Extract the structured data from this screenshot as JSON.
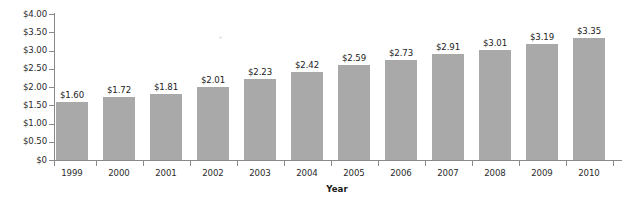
{
  "chart_data": {
    "type": "bar",
    "title": "",
    "xlabel": "Year",
    "ylabel": "",
    "categories": [
      "1999",
      "2000",
      "2001",
      "2002",
      "2003",
      "2004",
      "2005",
      "2006",
      "2007",
      "2008",
      "2009",
      "2010"
    ],
    "values": [
      1.6,
      1.72,
      1.81,
      2.01,
      2.23,
      2.42,
      2.59,
      2.73,
      2.91,
      3.01,
      3.19,
      3.35
    ],
    "data_labels": [
      "$1.60",
      "$1.72",
      "$1.81",
      "$2.01",
      "$2.23",
      "$2.42",
      "$2.59",
      "$2.73",
      "$2.91",
      "$3.01",
      "$3.19",
      "$3.35"
    ],
    "ylim": [
      0,
      4.0
    ],
    "ytick_values": [
      0,
      0.5,
      1.0,
      1.5,
      2.0,
      2.5,
      3.0,
      3.5,
      4.0
    ],
    "ytick_labels": [
      "$0",
      "$0.50",
      "$1.00",
      "$1.50",
      "$2.00",
      "$2.50",
      "$3.00",
      "$3.50",
      "$4.00"
    ],
    "grid": false,
    "legend": false,
    "bar_color": "#a9a9a9",
    "axis_color": "#8a8a8a",
    "text_color": "#2b2b2b",
    "background_color": "#ffffff"
  }
}
